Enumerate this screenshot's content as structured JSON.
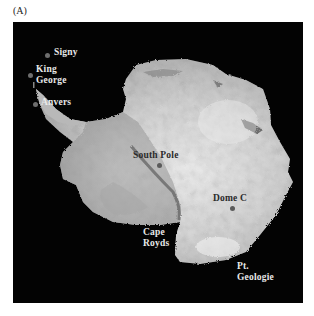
{
  "figure": {
    "panel_label": "(A)",
    "colors": {
      "ocean": "#030303",
      "ice_light": "#e6e6e6",
      "ice_mid": "#bdbdbd",
      "ice_dark": "#8a8a8a",
      "station_dot": "#6e6e6e"
    }
  },
  "sites": [
    {
      "name": "Signy",
      "line1": "Signy",
      "line2": ""
    },
    {
      "name": "King George",
      "line1": "King",
      "line2": "George"
    },
    {
      "name": "Anvers",
      "line1": "Anvers",
      "line2": ""
    },
    {
      "name": "South Pole",
      "line1": "South Pole",
      "line2": ""
    },
    {
      "name": "Dome C",
      "line1": "Dome C",
      "line2": ""
    },
    {
      "name": "Cape Royds",
      "line1": "Cape",
      "line2": "Royds"
    },
    {
      "name": "Pt. Geologie",
      "line1": "Pt.",
      "line2": "Geologie"
    }
  ]
}
